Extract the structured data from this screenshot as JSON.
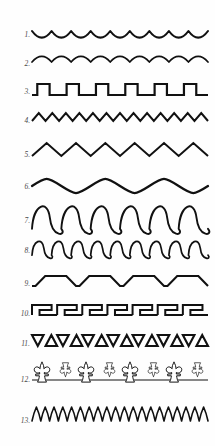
{
  "plate": {
    "title": "Ornamental Line and Border Patterns",
    "background_color": "#fefefe",
    "ink_color": "#111111",
    "label_color": "#4a4a4a",
    "width": 215,
    "height": 446,
    "row_count": 13
  },
  "rows": [
    {
      "number": "1.",
      "label": "1.",
      "name": "scalloped-arcs-up",
      "description": "Row of shallow arcs opening upward, cusps pointing up",
      "top": 22,
      "height": 26,
      "stroke_width": 2.1,
      "pattern_type": "arc-cups",
      "repeat_count": 9,
      "wavelength": 20,
      "amplitude": 7
    },
    {
      "number": "2.",
      "label": "2.",
      "name": "scalloped-arcs-down",
      "description": "Row of shallow arcs opening downward, bumps pointing up",
      "top": 52,
      "height": 24,
      "stroke_width": 1.7,
      "pattern_type": "arc-bumps",
      "repeat_count": 9,
      "wavelength": 20,
      "amplitude": 6
    },
    {
      "number": "3.",
      "label": "3.",
      "name": "square-wave",
      "description": "Crenellated square wave with flat tops and bottoms",
      "top": 80,
      "height": 24,
      "stroke_width": 2.2,
      "pattern_type": "square",
      "repeat_count": 6,
      "wavelength": 29,
      "amplitude": 11
    },
    {
      "number": "4.",
      "label": "4.",
      "name": "tight-zigzag",
      "description": "Narrow regular zigzag, sharp peaks",
      "top": 110,
      "height": 22,
      "stroke_width": 2.0,
      "pattern_type": "zigzag",
      "repeat_count": 13,
      "wavelength": 13.5,
      "amplitude": 8
    },
    {
      "number": "5.",
      "label": "5.",
      "name": "wide-zigzag",
      "description": "Wide tall zigzag, large chevrons",
      "top": 140,
      "height": 30,
      "stroke_width": 2.0,
      "pattern_type": "zigzag",
      "repeat_count": 6,
      "wavelength": 29,
      "amplitude": 13
    },
    {
      "number": "6.",
      "label": "6.",
      "name": "smooth-sine-wave",
      "description": "Smooth low-frequency sine wave, gentle undulation",
      "top": 176,
      "height": 22,
      "stroke_width": 2.3,
      "pattern_type": "sine",
      "repeat_count": 3,
      "wavelength": 58,
      "amplitude": 7
    },
    {
      "number": "7.",
      "label": "7.",
      "name": "interlocking-coils-tall",
      "description": "Row of tall interlocking S-scroll coils resembling linked spirals",
      "top": 206,
      "height": 30,
      "stroke_width": 1.9,
      "pattern_type": "coil",
      "repeat_count": 6,
      "wavelength": 29,
      "amplitude": 13
    },
    {
      "number": "8.",
      "label": "8.",
      "name": "interlocking-coils-flat",
      "description": "Row of flattened interlocking S-scroll coils, compressed vertically",
      "top": 240,
      "height": 22,
      "stroke_width": 1.7,
      "pattern_type": "coil",
      "repeat_count": 9,
      "wavelength": 19,
      "amplitude": 8
    },
    {
      "number": "9.",
      "label": "9.",
      "name": "slanted-step-wave",
      "description": "Angled step pattern with diagonal risers and flat treads",
      "top": 272,
      "height": 24,
      "stroke_width": 2.1,
      "pattern_type": "slanted-step",
      "repeat_count": 4,
      "wavelength": 43,
      "amplitude": 10
    },
    {
      "number": "10.",
      "label": "10.",
      "name": "greek-key-meander",
      "description": "Greek key meander border of interlocking rectangular hooks",
      "top": 302,
      "height": 24,
      "stroke_width": 2.0,
      "pattern_type": "meander",
      "repeat_count": 7,
      "wavelength": 25,
      "amplitude": 10
    },
    {
      "number": "11.",
      "label": "11.",
      "name": "alternating-triangles",
      "description": "Band of alternating upward and downward pointing triangles forming a Z sequence",
      "top": 332,
      "height": 24,
      "stroke_width": 2.1,
      "pattern_type": "triangles",
      "repeat_count": 7,
      "wavelength": 25,
      "amplitude": 11
    },
    {
      "number": "12.",
      "label": "12.",
      "name": "fleur-de-lis-band",
      "description": "Horizontal band with alternating large upright and small inverted fleur-de-lis motifs on a center rule",
      "top": 360,
      "height": 40,
      "stroke_width": 1.1,
      "pattern_type": "fleur-de-lis",
      "repeat_count": 4,
      "wavelength": 38,
      "amplitude": 18
    },
    {
      "number": "13.",
      "label": "13.",
      "name": "dense-flared-zigzag",
      "description": "Dense narrow zigzag of closely spaced flared vertical strokes",
      "top": 404,
      "height": 34,
      "stroke_width": 1.6,
      "pattern_type": "dense-zigzag",
      "repeat_count": 20,
      "wavelength": 8,
      "amplitude": 14
    }
  ]
}
